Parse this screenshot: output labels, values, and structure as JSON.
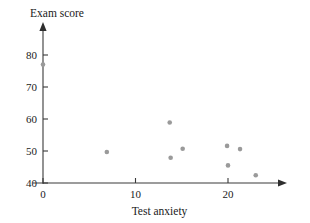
{
  "chart_data": {
    "type": "scatter",
    "title": "",
    "xlabel": "Test anxiety",
    "ylabel": "Exam score",
    "xlim": [
      -1.5,
      26.5
    ],
    "ylim": [
      38,
      84
    ],
    "grid": false,
    "legend": null,
    "xticks": [
      0,
      10,
      20
    ],
    "xtick_labels": [
      "0",
      "10",
      "20"
    ],
    "yticks": [
      40,
      50,
      60,
      70,
      80
    ],
    "ytick_labels": [
      "40",
      "50",
      "60",
      "70",
      "80"
    ],
    "marker_color": "#9a9a9a",
    "axis_color": "#3a3a3a",
    "points": [
      {
        "x": 0.0,
        "y": 77.0
      },
      {
        "x": 6.9,
        "y": 49.7
      },
      {
        "x": 13.7,
        "y": 58.9
      },
      {
        "x": 13.8,
        "y": 47.9
      },
      {
        "x": 15.1,
        "y": 50.7
      },
      {
        "x": 19.9,
        "y": 51.6
      },
      {
        "x": 20.0,
        "y": 45.5
      },
      {
        "x": 21.3,
        "y": 50.6
      },
      {
        "x": 23.0,
        "y": 42.4
      }
    ]
  },
  "geometry": {
    "origin_x": 43,
    "origin_y": 183,
    "x_per_unit": 9.25,
    "y_per_unit": 3.2,
    "axis_top_y": 22,
    "axis_right_x": 287,
    "marker_radius": 2.3,
    "tick_length": 5
  }
}
